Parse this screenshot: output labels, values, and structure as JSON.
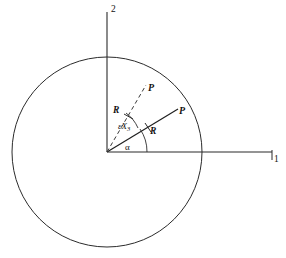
{
  "figure": {
    "kind": "geometry-diagram",
    "background_color": "#ffffff",
    "line_color": "#2b2b2b",
    "text_color": "#111111"
  },
  "axes": {
    "horizontal": {
      "label": "1",
      "name": "axis-1"
    },
    "vertical": {
      "label": "2",
      "name": "axis-2"
    }
  },
  "circle": {
    "center_x": 107,
    "center_y": 152,
    "radius": 95
  },
  "rays": {
    "solid": {
      "point_label": "P",
      "angle_deg": 33,
      "radius_label": "R",
      "style": "solid"
    },
    "dashed": {
      "point_label": "P",
      "angle_deg": 62,
      "radius_label": "R",
      "style": "dashed"
    }
  },
  "angles": {
    "alpha": {
      "label": "α"
    },
    "rotation": {
      "prefix": "ε",
      "variable": "X",
      "subscript": "3"
    }
  }
}
